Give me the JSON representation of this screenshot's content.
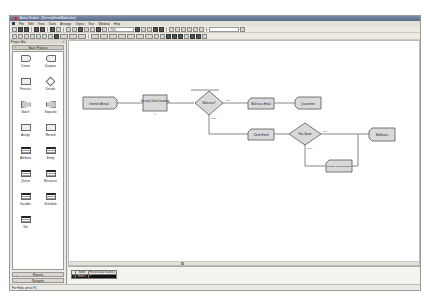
{
  "window": {
    "title": "Arena Student - [SecurityEmailModel.doe]"
  },
  "menubar": {
    "items": [
      "File",
      "Edit",
      "View",
      "Tools",
      "Arrange",
      "Object",
      "Run",
      "Window",
      "Help"
    ]
  },
  "toolbar": {
    "zoom_value": "70%",
    "icons": [
      "new-icon",
      "open-icon",
      "save-icon",
      "print-icon",
      "print-preview-icon",
      "cut-icon",
      "copy-icon",
      "paste-icon",
      "undo-icon",
      "redo-icon",
      "layers-icon",
      "zoom-icon",
      "run-icon",
      "pause-icon",
      "stop-icon",
      "step-icon",
      "help-icon"
    ]
  },
  "project_bar": {
    "title": "Project Bar",
    "panel_title": "Basic Process",
    "modules": [
      {
        "label": "Create",
        "shape": "create"
      },
      {
        "label": "Dispose",
        "shape": "dispose"
      },
      {
        "label": "Process",
        "shape": "process"
      },
      {
        "label": "Decide",
        "shape": "decide"
      },
      {
        "label": "Batch",
        "shape": "batch"
      },
      {
        "label": "Separate",
        "shape": "separate"
      },
      {
        "label": "Assign",
        "shape": "process"
      },
      {
        "label": "Record",
        "shape": "process"
      },
      {
        "label": "Attribute",
        "shape": "data"
      },
      {
        "label": "Entity",
        "shape": "data"
      },
      {
        "label": "Queue",
        "shape": "data"
      },
      {
        "label": "Resource",
        "shape": "data"
      },
      {
        "label": "Variable",
        "shape": "data"
      },
      {
        "label": "Schedule",
        "shape": "data"
      },
      {
        "label": "Set",
        "shape": "data"
      }
    ],
    "bottom_panels": [
      "Reports",
      "Navigate"
    ]
  },
  "flowchart": {
    "blocks": [
      {
        "id": "internet-arrival",
        "type": "create",
        "label": "Internet Arrival"
      },
      {
        "id": "security-check",
        "type": "process",
        "label": "Security Check Incoming"
      },
      {
        "id": "malicious",
        "type": "decide",
        "label": "Malicious?",
        "true_label": "True",
        "false_label": "False"
      },
      {
        "id": "malicious-email",
        "type": "assign",
        "label": "Malicious Email"
      },
      {
        "id": "quarantine",
        "type": "dispose",
        "label": "Quarantine"
      },
      {
        "id": "clean-email",
        "type": "assign",
        "label": "Clean Email"
      },
      {
        "id": "has-spam",
        "type": "decide",
        "label": "Has Spam",
        "true_label": "True",
        "false_label": "False"
      },
      {
        "id": "mailboxes",
        "type": "dispose",
        "label": "Mailboxes"
      },
      {
        "id": "upload-antivirus",
        "type": "assign",
        "label": "Upload Antivirus Block"
      }
    ]
  },
  "spreadsheet": {
    "columns": [
      "",
      "Name",
      "Record Data Statistics"
    ],
    "rows": [
      [
        "1",
        "Name 1",
        "?"
      ]
    ]
  },
  "statusbar": {
    "text": "For Help, press F1"
  }
}
